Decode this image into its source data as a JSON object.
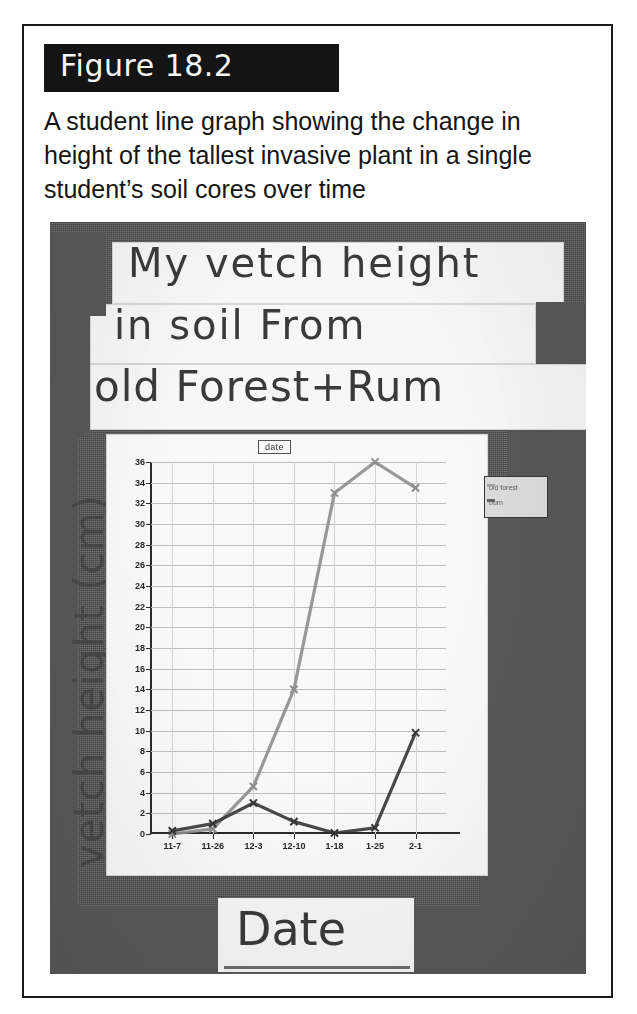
{
  "figure": {
    "number_label": "Figure 18.2",
    "caption": "A student line graph showing the change in height of the tallest invasive plant in a single student’s soil cores over time"
  },
  "photo": {
    "handwritten_title_line_1": "My vetch height",
    "handwritten_title_line_2": "in soil From",
    "handwritten_title_line_3": "old Forest+Rum",
    "handwritten_y_axis_label": "vetch height (cm)",
    "handwritten_x_axis_label": "Date"
  },
  "chart_data": {
    "type": "line",
    "title": "date",
    "xlabel": "Date",
    "ylabel": "vetch height (cm)",
    "categories": [
      "11-7",
      "11-26",
      "12-3",
      "12-10",
      "1-18",
      "1-25",
      "2-1"
    ],
    "ylim": [
      0,
      36
    ],
    "ytick_step": 2,
    "yticks": [
      0,
      2,
      4,
      6,
      8,
      10,
      12,
      14,
      16,
      18,
      20,
      22,
      24,
      26,
      28,
      30,
      32,
      34,
      36
    ],
    "grid": true,
    "legend_position": "right",
    "series": [
      {
        "name": "old forest",
        "color": "#8d8d8d",
        "marker": "x",
        "values": [
          0,
          0.5,
          4.6,
          14.0,
          33.0,
          36.0,
          33.5
        ]
      },
      {
        "name": "burn",
        "color": "#3a3a3a",
        "marker": "x",
        "values": [
          0.3,
          1.0,
          3.0,
          1.2,
          0.1,
          0.6,
          9.8
        ]
      }
    ]
  },
  "legend": {
    "entries": [
      {
        "label": "old forest"
      },
      {
        "label": "burn"
      }
    ]
  },
  "colors": {
    "banner_background": "#141414",
    "banner_text": "#f7f7f7",
    "page_border": "#1a1a1a",
    "photo_mat": "#585858",
    "paper": "#f2f1ee",
    "series_light": "#8d8d8d",
    "series_dark": "#3a3a3a"
  }
}
